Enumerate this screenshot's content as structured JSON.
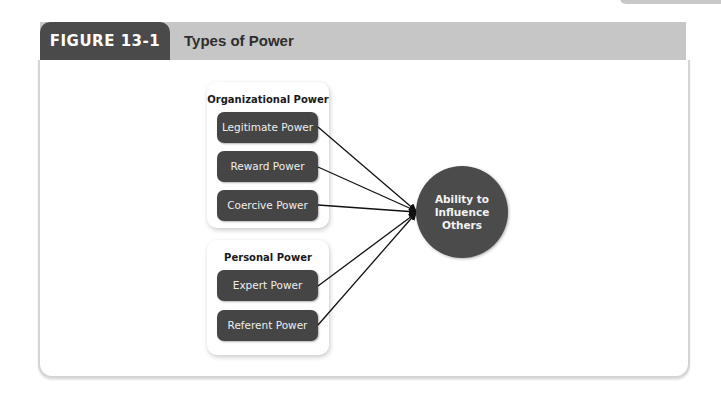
{
  "figure": {
    "label": "FIGURE 13-1",
    "title": "Types of Power"
  },
  "diagram": {
    "groups": [
      {
        "title": "Organizational Power",
        "nodes": [
          "Legitimate Power",
          "Reward Power",
          "Coercive Power"
        ]
      },
      {
        "title": "Personal Power",
        "nodes": [
          "Expert Power",
          "Referent Power"
        ]
      }
    ],
    "target": "Ability to Influence Others",
    "edges": [
      {
        "from": "Legitimate Power",
        "to": "Ability to Influence Others"
      },
      {
        "from": "Reward Power",
        "to": "Ability to Influence Others"
      },
      {
        "from": "Coercive Power",
        "to": "Ability to Influence Others"
      },
      {
        "from": "Expert Power",
        "to": "Ability to Influence Others"
      },
      {
        "from": "Referent Power",
        "to": "Ability to Influence Others"
      }
    ]
  },
  "colors": {
    "header_dark": "#4a4a4a",
    "header_bar": "#c6c6c6",
    "node_fill": "#454545",
    "circle_fill": "#4b4b4b"
  }
}
